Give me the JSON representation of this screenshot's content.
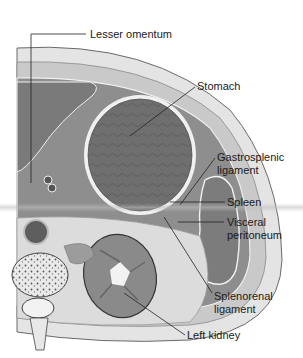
{
  "figure": {
    "labels": [
      {
        "id": "lesser-omentum",
        "text": "Lesser omentum"
      },
      {
        "id": "stomach",
        "text": "Stomach"
      },
      {
        "id": "gastrosplenic-ligament",
        "text": "Gastrosplenic\nligament"
      },
      {
        "id": "spleen",
        "text": "Spleen"
      },
      {
        "id": "visceral-peritoneum",
        "text": "Visceral\nperitoneum"
      },
      {
        "id": "splenorenal-ligament",
        "text": "Splenorenal\nligament"
      },
      {
        "id": "left-kidney",
        "text": "Left kidney"
      }
    ],
    "colors": {
      "background": "#ffffff",
      "skin_fat": "#e6e6e6",
      "muscle_wall": "#bdbdbd",
      "cavity": "#8c8c8c",
      "organ_dark": "#6e6e6e",
      "membrane": "#f2f2f2",
      "leader_line": "#222222",
      "text": "#1a1a1a"
    }
  }
}
